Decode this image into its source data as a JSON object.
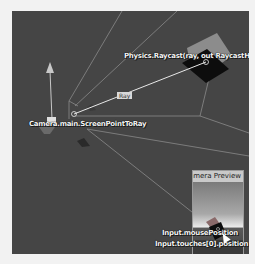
{
  "scene": {
    "labels": {
      "raycast": "Physics.Raycast(ray, out RaycastHit hit)",
      "screen_point": "Camera.main.ScreenPointToRay",
      "ray": "Ray",
      "mouse": "Input.mousePosition",
      "touch": "Input.touches[0].position"
    },
    "colors": {
      "background": "#454545",
      "frustum_line": "#8a8a8a",
      "ray_line": "#e8e8e8",
      "cube_top": "#8c8c8c",
      "cube_face": "#0d0d0d"
    }
  },
  "preview": {
    "title": "Camera Preview"
  }
}
